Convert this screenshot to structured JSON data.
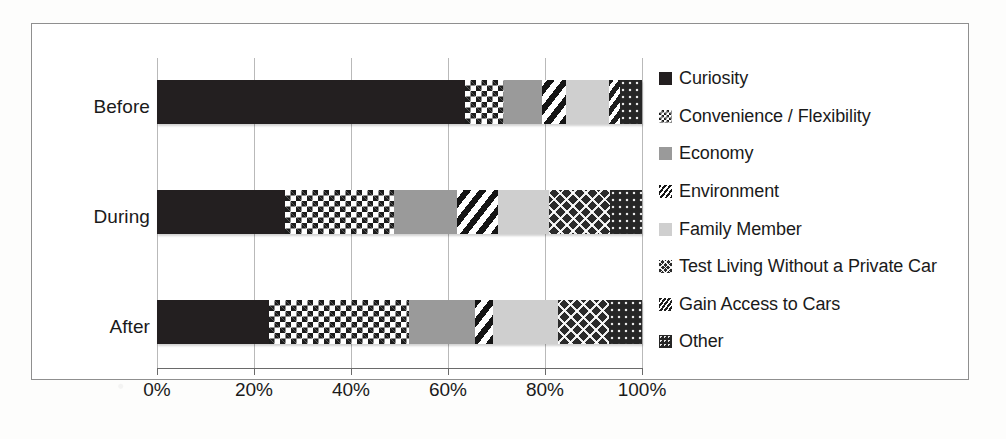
{
  "chart_data": {
    "type": "bar",
    "orientation": "horizontal",
    "stacked": true,
    "normalized": true,
    "title": "",
    "xlabel": "",
    "ylabel": "",
    "xlim": [
      0,
      100
    ],
    "grid": true,
    "legend_position": "right",
    "categories": [
      "Before",
      "During",
      "After"
    ],
    "xtick_labels": [
      "0%",
      "20%",
      "40%",
      "60%",
      "80%",
      "100%"
    ],
    "xtick_values": [
      0,
      20,
      40,
      60,
      80,
      100
    ],
    "series": [
      {
        "name": "Curiosity",
        "pattern": "solid-black",
        "values": [
          63.5,
          26.4,
          23.0
        ]
      },
      {
        "name": "Convenience / Flexibility",
        "pattern": "checkerboard",
        "values": [
          8.0,
          22.5,
          29.0
        ]
      },
      {
        "name": "Economy",
        "pattern": "solid-gray",
        "values": [
          7.8,
          13.0,
          13.6
        ]
      },
      {
        "name": "Environment",
        "pattern": "diagonal-stripe",
        "values": [
          5.0,
          8.5,
          3.7
        ]
      },
      {
        "name": "Family Member",
        "pattern": "solid-light-gray",
        "values": [
          8.9,
          10.5,
          13.4
        ]
      },
      {
        "name": "Test Living Without a Private Car",
        "pattern": "cross-hatch",
        "values": [
          0.0,
          12.6,
          10.5
        ]
      },
      {
        "name": "Gain Access to Cars",
        "pattern": "bold-stripe",
        "values": [
          2.3,
          0.0,
          0.0
        ]
      },
      {
        "name": "Other",
        "pattern": "dotted-dark",
        "values": [
          4.5,
          6.6,
          6.8
        ]
      }
    ]
  },
  "legend": {
    "items": [
      {
        "label": "Curiosity"
      },
      {
        "label": "Convenience / Flexibility"
      },
      {
        "label": "Economy"
      },
      {
        "label": "Environment"
      },
      {
        "label": "Family Member"
      },
      {
        "label": "Test Living Without a Private Car"
      },
      {
        "label": "Gain Access to Cars"
      },
      {
        "label": "Other"
      }
    ]
  }
}
